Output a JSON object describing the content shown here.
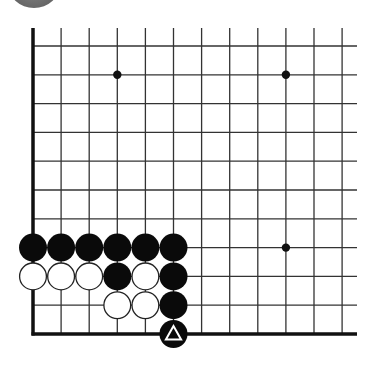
{
  "board": {
    "origin_x": 33,
    "origin_y": 46,
    "spacing_x": 28.1,
    "spacing_y": 28.8,
    "cols": 12,
    "rows": 11,
    "line_top": 28,
    "line_right": 357,
    "line_color": "#333333",
    "edge_color": "#111111",
    "stone_radius": 14,
    "star_points": [
      [
        3,
        1
      ],
      [
        9,
        1
      ],
      [
        9,
        7
      ]
    ],
    "stones": [
      {
        "col": 0,
        "row": 7,
        "color": "black"
      },
      {
        "col": 1,
        "row": 7,
        "color": "black"
      },
      {
        "col": 2,
        "row": 7,
        "color": "black"
      },
      {
        "col": 3,
        "row": 7,
        "color": "black"
      },
      {
        "col": 4,
        "row": 7,
        "color": "black"
      },
      {
        "col": 5,
        "row": 7,
        "color": "black"
      },
      {
        "col": 0,
        "row": 8,
        "color": "white"
      },
      {
        "col": 1,
        "row": 8,
        "color": "white"
      },
      {
        "col": 2,
        "row": 8,
        "color": "white"
      },
      {
        "col": 3,
        "row": 8,
        "color": "black"
      },
      {
        "col": 4,
        "row": 8,
        "color": "white"
      },
      {
        "col": 5,
        "row": 8,
        "color": "black"
      },
      {
        "col": 3,
        "row": 9,
        "color": "white"
      },
      {
        "col": 4,
        "row": 9,
        "color": "white"
      },
      {
        "col": 5,
        "row": 9,
        "color": "black"
      },
      {
        "col": 5,
        "row": 10,
        "color": "black",
        "mark": "triangle"
      }
    ]
  }
}
